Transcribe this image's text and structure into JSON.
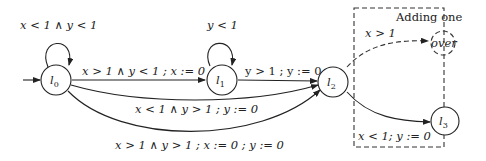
{
  "diagram": {
    "type": "timed-automaton",
    "box_title": "Adding one",
    "nodes": [
      {
        "id": "l0",
        "label": "l",
        "sub": "0",
        "initial": true
      },
      {
        "id": "l1",
        "label": "l",
        "sub": "1"
      },
      {
        "id": "l2",
        "label": "l",
        "sub": "2"
      },
      {
        "id": "l3",
        "label": "l",
        "sub": "3"
      },
      {
        "id": "over",
        "label": "over",
        "dashed": true
      }
    ],
    "edges": [
      {
        "from": "l0",
        "to": "l0",
        "label": "x < 1 ∧ y < 1"
      },
      {
        "from": "l1",
        "to": "l1",
        "label": "y < 1"
      },
      {
        "from": "l0",
        "to": "l1",
        "label": "x > 1 ∧ y < 1 ; x := 0"
      },
      {
        "from": "l1",
        "to": "l2",
        "label": "y > 1 ; y := 0"
      },
      {
        "from": "l0",
        "to": "l2",
        "label": "x < 1 ∧ y > 1 ; y := 0"
      },
      {
        "from": "l0",
        "to": "l2",
        "label": "x > 1 ∧ y > 1 ; x := 0 ; y := 0"
      },
      {
        "from": "l2",
        "to": "over",
        "label": "x > 1",
        "dashed": true
      },
      {
        "from": "l2",
        "to": "l3",
        "label": "x < 1; y := 0"
      }
    ]
  }
}
